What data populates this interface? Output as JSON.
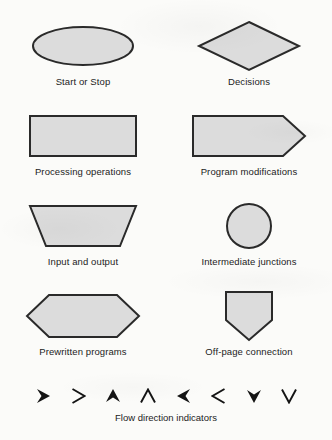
{
  "page": {
    "background_color": "#fbfbf9",
    "shape_fill_color": "#dcdcdc",
    "shape_stroke_color": "#2a2a2a",
    "text_color": "#1c1c1c"
  },
  "symbols": [
    {
      "id": "start-or-stop",
      "label": "Start or Stop",
      "shape": "ellipse",
      "column": "left",
      "row": 1
    },
    {
      "id": "decisions",
      "label": "Decisions",
      "shape": "diamond",
      "column": "right",
      "row": 1
    },
    {
      "id": "processing-operations",
      "label": "Processing operations",
      "shape": "rectangle",
      "column": "left",
      "row": 2
    },
    {
      "id": "program-modifications",
      "label": "Program modifications",
      "shape": "pentagon-right-point",
      "column": "right",
      "row": 2
    },
    {
      "id": "input-and-output",
      "label": "Input and output",
      "shape": "trapezoid",
      "column": "left",
      "row": 3
    },
    {
      "id": "intermediate-junctions",
      "label": "Intermediate junctions",
      "shape": "circle",
      "column": "right",
      "row": 3
    },
    {
      "id": "prewritten-programs",
      "label": "Prewritten programs",
      "shape": "hexagon",
      "column": "left",
      "row": 4
    },
    {
      "id": "off-page-connection",
      "label": "Off-page connection",
      "shape": "pentagon-down-point",
      "column": "right",
      "row": 4
    }
  ],
  "flow_indicators": {
    "caption": "Flow direction indicators",
    "arrows": [
      {
        "id": "arrow-right-filled",
        "direction": "right",
        "style": "filled"
      },
      {
        "id": "arrow-right-outline",
        "direction": "right",
        "style": "outline"
      },
      {
        "id": "arrow-up-filled",
        "direction": "up",
        "style": "filled"
      },
      {
        "id": "arrow-up-outline",
        "direction": "up",
        "style": "outline"
      },
      {
        "id": "arrow-left-filled",
        "direction": "left",
        "style": "filled"
      },
      {
        "id": "arrow-left-outline",
        "direction": "left",
        "style": "outline"
      },
      {
        "id": "arrow-down-filled",
        "direction": "down",
        "style": "filled"
      },
      {
        "id": "arrow-down-outline",
        "direction": "down",
        "style": "outline"
      }
    ]
  }
}
